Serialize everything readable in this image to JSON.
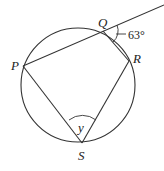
{
  "diagram": {
    "type": "circle-geometry",
    "circle": {
      "cx": 78,
      "cy": 85,
      "r": 57
    },
    "points": {
      "P": {
        "label": "P",
        "x": 23,
        "y": 66
      },
      "Q": {
        "label": "Q",
        "x": 103,
        "y": 31
      },
      "R": {
        "label": "R",
        "x": 129,
        "y": 61
      },
      "S": {
        "label": "S",
        "x": 82,
        "y": 143
      }
    },
    "angles": {
      "exterior_at_Q": {
        "label": "63°"
      },
      "at_S": {
        "label": "y"
      }
    },
    "colors": {
      "stroke": "#333333",
      "background": "#ffffff"
    }
  }
}
